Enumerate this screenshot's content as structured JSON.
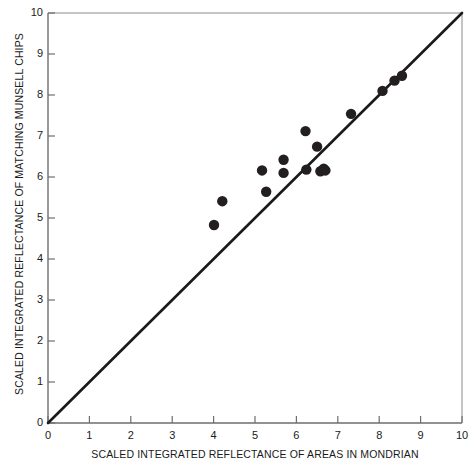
{
  "chart_data": {
    "type": "scatter",
    "title": "",
    "xlabel": "SCALED INTEGRATED REFLECTANCE OF AREAS IN MONDRIAN",
    "ylabel": "SCALED INTEGRATED REFLECTANCE OF MATCHING MUNSELL CHIPS",
    "xlim": [
      0,
      10
    ],
    "ylim": [
      0,
      10
    ],
    "xticks": [
      0,
      1,
      2,
      3,
      4,
      5,
      6,
      7,
      8,
      9,
      10
    ],
    "yticks": [
      0,
      1,
      2,
      3,
      4,
      5,
      6,
      7,
      8,
      9,
      10
    ],
    "xtick_labels": [
      "0",
      "1",
      "2",
      "3",
      "4",
      "5",
      "6",
      "7",
      "8",
      "9",
      "10"
    ],
    "ytick_labels": [
      "0",
      "1",
      "2",
      "3",
      "4",
      "5",
      "6",
      "7",
      "8",
      "9",
      "10"
    ],
    "grid": false,
    "legend": null,
    "reference_line": {
      "name": "identity-line",
      "description": "y = x diagonal",
      "from": [
        0,
        0
      ],
      "to": [
        10,
        10
      ],
      "color": "#1a1a1a",
      "width": 2.6
    },
    "marker": {
      "shape": "filled-circle",
      "color": "#231f20",
      "radius_px": 5.2
    },
    "points": [
      {
        "x": 4.01,
        "y": 4.83
      },
      {
        "x": 4.21,
        "y": 5.41
      },
      {
        "x": 5.17,
        "y": 6.16
      },
      {
        "x": 5.27,
        "y": 5.64
      },
      {
        "x": 5.69,
        "y": 6.42
      },
      {
        "x": 5.69,
        "y": 6.1
      },
      {
        "x": 6.22,
        "y": 7.12
      },
      {
        "x": 6.24,
        "y": 6.18
      },
      {
        "x": 6.5,
        "y": 6.74
      },
      {
        "x": 6.58,
        "y": 6.14
      },
      {
        "x": 6.66,
        "y": 6.2
      },
      {
        "x": 6.7,
        "y": 6.16
      },
      {
        "x": 7.32,
        "y": 7.54
      },
      {
        "x": 8.08,
        "y": 8.1
      },
      {
        "x": 8.37,
        "y": 8.35
      },
      {
        "x": 8.55,
        "y": 8.47
      }
    ]
  },
  "axes": {
    "x_axis_name": "x-axis",
    "y_axis_name": "y-axis"
  }
}
